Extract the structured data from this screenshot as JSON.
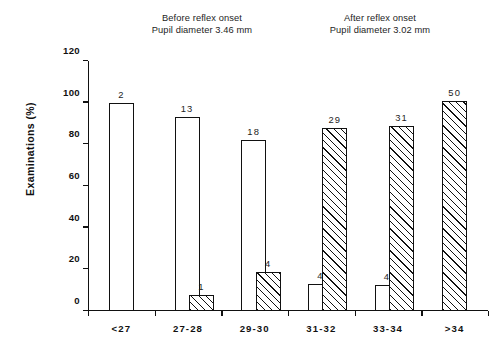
{
  "headers": {
    "before": {
      "line1": "Before reflex onset",
      "line2": "Pupil diameter 3.46 mm"
    },
    "after": {
      "line1": "After reflex onset",
      "line2": "Pupil diameter 3.02 mm"
    }
  },
  "chart_data": {
    "type": "bar",
    "title": "",
    "xlabel": "",
    "ylabel": "Examinations  (%)",
    "ylim": [
      0,
      120
    ],
    "yticks": [
      0,
      20,
      40,
      60,
      80,
      100,
      120
    ],
    "ytick_labels": [
      "0",
      "20",
      "40",
      "60",
      "80",
      "100",
      "120"
    ],
    "grid": false,
    "legend_position": "top-as-annotations",
    "categories": [
      "<27",
      "27-28",
      "29-30",
      "31-32",
      "33-34",
      ">34"
    ],
    "series": [
      {
        "name": "Before reflex onset",
        "fill": "white",
        "values": [
          100,
          93,
          82,
          13,
          12.5,
          null
        ],
        "counts": [
          "2",
          "13",
          "18",
          "4",
          "4",
          null
        ]
      },
      {
        "name": "After reflex onset",
        "fill": "hatched",
        "values": [
          null,
          7.5,
          18.5,
          88,
          89,
          101
        ],
        "counts": [
          null,
          "1",
          "4",
          "29",
          "31",
          "50"
        ]
      }
    ],
    "annotations": [
      "Before reflex onset",
      "Pupil diameter 3.46 mm",
      "After reflex onset",
      "Pupil diameter 3.02 mm"
    ]
  },
  "colors": {
    "ink": "#111111",
    "background": "#ffffff"
  }
}
